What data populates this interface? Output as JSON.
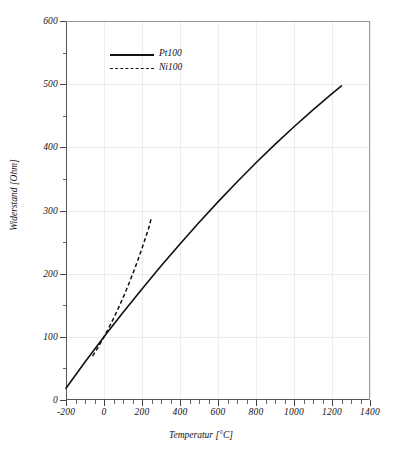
{
  "chart_data": {
    "type": "line",
    "title": "",
    "xlabel": "Temperatur [°C]",
    "ylabel": "Widerstand [Ohm]",
    "xlim": [
      -200,
      1400
    ],
    "ylim": [
      0,
      600
    ],
    "xticks": [
      -200,
      0,
      200,
      400,
      600,
      800,
      1000,
      1200,
      1400
    ],
    "xtick_labels": [
      "-200",
      "0",
      "200",
      "400",
      "600",
      "800",
      "1000",
      "1200",
      "1400"
    ],
    "yticks": [
      0,
      100,
      200,
      300,
      400,
      500,
      600
    ],
    "ytick_labels": [
      "0",
      "100",
      "200",
      "300",
      "400",
      "500",
      "600"
    ],
    "x_minor_step": 50,
    "y_minor_step": 50,
    "grid": true,
    "grid_color": "#ececec",
    "legend_position": "upper-left-inside",
    "series": [
      {
        "name": "Pt100",
        "style": "solid",
        "color": "#111111",
        "x": [
          -200,
          -100,
          0,
          100,
          200,
          300,
          400,
          500,
          600,
          700,
          800,
          900,
          1000,
          1100,
          1200,
          1250
        ],
        "y": [
          18.5,
          60.3,
          100.0,
          138.5,
          175.8,
          212.0,
          247.1,
          280.9,
          313.7,
          345.1,
          375.5,
          404.6,
          432.6,
          459.3,
          484.9,
          497.2
        ]
      },
      {
        "name": "Ni100",
        "style": "dashed",
        "color": "#111111",
        "x": [
          -60,
          -40,
          -20,
          0,
          20,
          40,
          60,
          80,
          100,
          120,
          140,
          160,
          180,
          200,
          220,
          240,
          250
        ],
        "y": [
          69.5,
          79.1,
          89.3,
          100.0,
          111.2,
          123.0,
          135.3,
          148.2,
          161.8,
          176.0,
          190.9,
          206.5,
          222.8,
          240.0,
          257.9,
          276.7,
          290.0
        ]
      }
    ]
  },
  "legend": {
    "items": [
      {
        "label": "Pt100",
        "style": "solid"
      },
      {
        "label": "Ni100",
        "style": "dashed"
      }
    ]
  },
  "caption": {
    "partial_text": ""
  }
}
